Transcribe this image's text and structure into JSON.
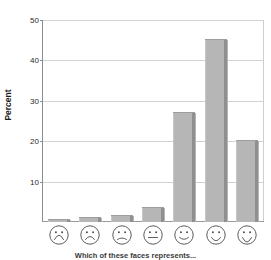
{
  "chart_data": {
    "type": "bar",
    "title": "",
    "xlabel": "Which of these faces represents...",
    "ylabel": "Percent",
    "categories": [
      "very-sad-face",
      "sad-face",
      "slightly-sad-face",
      "neutral-face",
      "slightly-happy-face",
      "happy-face",
      "very-happy-face"
    ],
    "values": [
      0.5,
      1,
      1.5,
      3.5,
      27,
      45,
      20
    ],
    "ylim": [
      0,
      50
    ],
    "yticks": [
      10,
      20,
      30,
      40,
      50
    ],
    "ytick_labels": [
      "10",
      "20",
      "30",
      "40",
      "50"
    ],
    "grid": true,
    "legend": "none",
    "bar_color": "#b6b6b6",
    "bar_shadow_color": "#8f8f8f",
    "grid_color": "#d2d2d2",
    "axis_color": "#8c8c8c",
    "text_color": "#1a1a1a"
  },
  "axes": {
    "y_title": "Percent",
    "x_title": "Which of these faces represents..."
  }
}
